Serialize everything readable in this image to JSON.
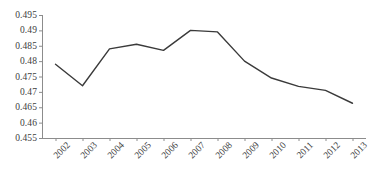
{
  "chart_data": {
    "type": "line",
    "title": "",
    "subtitle": "",
    "xlabel": "",
    "ylabel": "",
    "categories": [
      "2002",
      "2003",
      "2004",
      "2005",
      "2006",
      "2007",
      "2008",
      "2009",
      "2010",
      "2011",
      "2012",
      "2013"
    ],
    "values": [
      0.479,
      0.472,
      0.484,
      0.4855,
      0.4835,
      0.49,
      0.4895,
      0.48,
      0.4745,
      0.4718,
      0.4705,
      0.4663
    ],
    "series": [
      {
        "name": "",
        "values": [
          0.479,
          0.472,
          0.484,
          0.4855,
          0.4835,
          0.49,
          0.4895,
          0.48,
          0.4745,
          0.4718,
          0.4705,
          0.4663
        ]
      }
    ],
    "ylim": [
      0.455,
      0.495
    ],
    "ytick_step": 0.005,
    "ytick_labels": [
      "0.495",
      "0.49",
      "0.485",
      "0.48",
      "0.475",
      "0.47",
      "0.465",
      "0.46",
      "0.455"
    ],
    "ytick_values": [
      0.495,
      0.49,
      0.485,
      0.48,
      0.475,
      0.47,
      0.465,
      0.46,
      0.455
    ],
    "grid": false,
    "legend": false,
    "legend_position": "none",
    "markers": false,
    "line_color": "#3a3a3a",
    "axis_color": "#8c8c8c",
    "background_color": "#ffffff",
    "annotations": []
  }
}
